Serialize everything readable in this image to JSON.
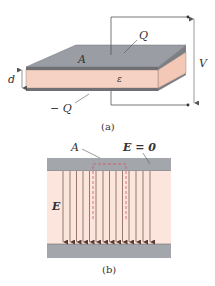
{
  "figure_a": {
    "caption": "(a)",
    "labels": {
      "area": "A",
      "top_charge": "Q",
      "bottom_charge": "− Q",
      "separation": "d",
      "permittivity": "ε",
      "voltage": "V"
    }
  },
  "figure_b": {
    "caption": "(b)",
    "labels": {
      "area": "A",
      "field_outside": "E = 0",
      "field_inside": "E"
    },
    "arrow_count": 14
  },
  "colors": {
    "plate": "#9a9da3",
    "plate_light": "#b9bcc1",
    "dielectric": "#f6d2c4",
    "dielectric_side": "#f3c8b6",
    "field_region": "#fbe5dc",
    "arrow": "#6b4a3e",
    "dashed": "#d9506b",
    "wire": "#555555"
  }
}
